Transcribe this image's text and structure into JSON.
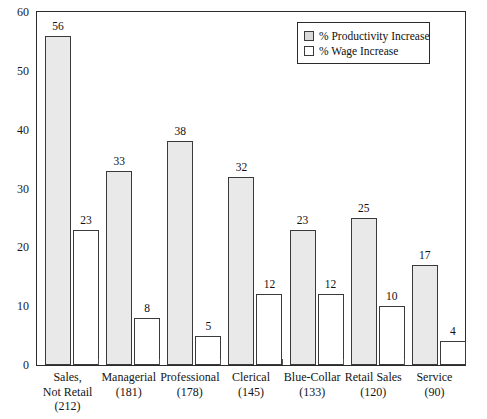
{
  "chart_data": {
    "type": "bar",
    "title": "",
    "subtitle": "",
    "xlabel": "",
    "ylabel": "",
    "ylim": [
      0,
      60
    ],
    "yticks": [
      0,
      10,
      20,
      30,
      40,
      50,
      60
    ],
    "ytick_labels": [
      "0",
      "10",
      "20",
      "30",
      "40",
      "50",
      "60"
    ],
    "grid": false,
    "legend_position": "upper-right",
    "categories": [
      "Sales,\nNot Retail\n(212)",
      "Managerial\n(181)",
      "Professional\n(178)",
      "Clerical\n(145)",
      "Blue-Collar\n(133)",
      "Retail Sales\n(120)",
      "Service\n(90)"
    ],
    "category_lines": [
      [
        "Sales,",
        "Not Retail",
        "(212)"
      ],
      [
        "Managerial",
        "(181)"
      ],
      [
        "Professional",
        "(178)"
      ],
      [
        "Clerical",
        "(145)"
      ],
      [
        "Blue-Collar",
        "(133)"
      ],
      [
        "Retail Sales",
        "(120)"
      ],
      [
        "Service",
        "(90)"
      ]
    ],
    "category_counts": [
      212,
      181,
      178,
      145,
      133,
      120,
      90
    ],
    "series": [
      {
        "name": "% Productivity Increase",
        "values": [
          56,
          33,
          38,
          32,
          23,
          25,
          17
        ],
        "color": "#e9e9e9"
      },
      {
        "name": "% Wage Increase",
        "values": [
          23,
          8,
          5,
          12,
          12,
          10,
          4
        ],
        "color": "#ffffff"
      }
    ]
  },
  "legend": {
    "items": [
      {
        "label": "% Productivity Increase",
        "swatch": "gray-filled-square-icon"
      },
      {
        "label": "% Wage Increase",
        "swatch": "white-square-icon"
      }
    ]
  }
}
